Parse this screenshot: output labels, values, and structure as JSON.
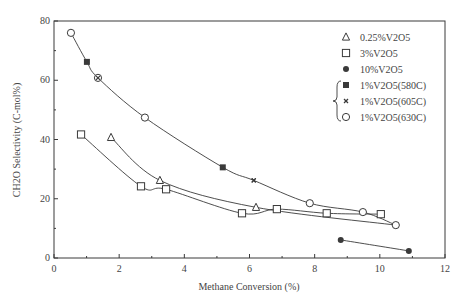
{
  "chart_data": {
    "type": "scatter",
    "title": "",
    "xlabel": "Methane Conversion (%)",
    "ylabel": "CH2O Selectivity (C-mol%)",
    "xlim": [
      0,
      12
    ],
    "ylim": [
      0,
      80
    ],
    "xticks": [
      0,
      2,
      4,
      6,
      8,
      10,
      12
    ],
    "yticks": [
      0,
      20,
      40,
      60,
      80
    ],
    "grid": false,
    "legend_position": "upper right",
    "series": [
      {
        "name": "0.25%V2O5",
        "marker": "triangle-open",
        "x": [
          1.75,
          3.25,
          6.2
        ],
        "y": [
          40.7,
          26.2,
          17.1
        ]
      },
      {
        "name": "3%V2O5",
        "marker": "square-open",
        "x": [
          0.83,
          2.67,
          3.44,
          5.77,
          6.84,
          8.37,
          10.03
        ],
        "y": [
          41.7,
          24.2,
          23.2,
          15.1,
          16.5,
          15.1,
          14.8
        ]
      },
      {
        "name": "10%V2O5",
        "marker": "circle-filled",
        "x": [
          8.8,
          10.89
        ],
        "y": [
          6.1,
          2.4
        ]
      },
      {
        "name": "1%V2O5(580C)",
        "marker": "square-filled",
        "x": [
          1.01,
          5.18
        ],
        "y": [
          66.2,
          30.6
        ]
      },
      {
        "name": "1%V2O5(605C)",
        "marker": "cross",
        "x": [
          1.35,
          6.13
        ],
        "y": [
          60.8,
          26.2
        ]
      },
      {
        "name": "1%V2O5(630C)",
        "marker": "circle-open",
        "x": [
          0.52,
          1.35,
          2.79,
          7.85,
          9.48,
          10.49
        ],
        "y": [
          76.0,
          60.8,
          47.4,
          18.5,
          15.5,
          11.1
        ]
      }
    ],
    "trend_lines": [
      {
        "name": "1%V2O5 combined",
        "x": [
          0.52,
          1.01,
          1.35,
          2.79,
          5.18,
          6.13,
          7.85,
          9.48,
          10.49
        ],
        "y": [
          76.0,
          66.2,
          60.8,
          47.4,
          30.6,
          26.2,
          18.5,
          15.5,
          11.1
        ]
      },
      {
        "name": "0.25%V2O5",
        "x": [
          1.75,
          3.25,
          6.2,
          10.49
        ],
        "y": [
          40.7,
          26.2,
          17.1,
          11.1
        ]
      },
      {
        "name": "3%V2O5",
        "x": [
          0.83,
          2.67,
          3.44,
          5.77,
          6.84,
          8.37,
          10.03
        ],
        "y": [
          41.7,
          24.2,
          23.2,
          15.1,
          16.5,
          15.1,
          14.8
        ]
      },
      {
        "name": "10%V2O5",
        "x": [
          8.8,
          10.89
        ],
        "y": [
          6.1,
          2.4
        ]
      }
    ],
    "annotations": [
      "brace grouping 1%V2O5 temperature series in legend"
    ]
  },
  "colors": {
    "ink": "#3a3a3a",
    "background": "#ffffff"
  }
}
